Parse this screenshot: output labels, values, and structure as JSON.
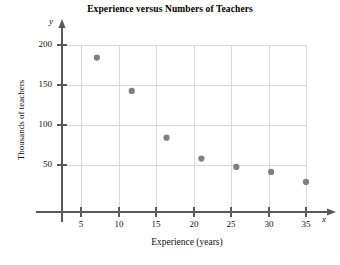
{
  "chart_data": {
    "type": "scatter",
    "title": "Experience versus Numbers of Teachers",
    "xlabel": "Experience (years)",
    "ylabel": "Thousands of teachers",
    "x_axis_variable": "x",
    "y_axis_variable": "y",
    "x": [
      5,
      10,
      15,
      20,
      25,
      30,
      35
    ],
    "values": [
      185,
      145,
      89,
      64,
      54,
      48,
      36
    ],
    "points": [
      {
        "x": 5,
        "y": 185
      },
      {
        "x": 10,
        "y": 145
      },
      {
        "x": 15,
        "y": 89
      },
      {
        "x": 20,
        "y": 64
      },
      {
        "x": 25,
        "y": 54
      },
      {
        "x": 30,
        "y": 48
      },
      {
        "x": 35,
        "y": 36
      }
    ],
    "xlim": [
      0,
      37.5
    ],
    "ylim": [
      0,
      212
    ],
    "xticks": [
      5,
      10,
      15,
      20,
      25,
      30,
      35
    ],
    "yticks": [
      50,
      100,
      150,
      200
    ],
    "xtick_labels": [
      "5",
      "10",
      "15",
      "20",
      "25",
      "30",
      "35"
    ],
    "ytick_labels": [
      "50",
      "100",
      "150",
      "200"
    ],
    "grid": true,
    "legend": null,
    "marker_color": "#808080",
    "grid_color": "#d9d9d9",
    "axis_color": "#595959"
  }
}
